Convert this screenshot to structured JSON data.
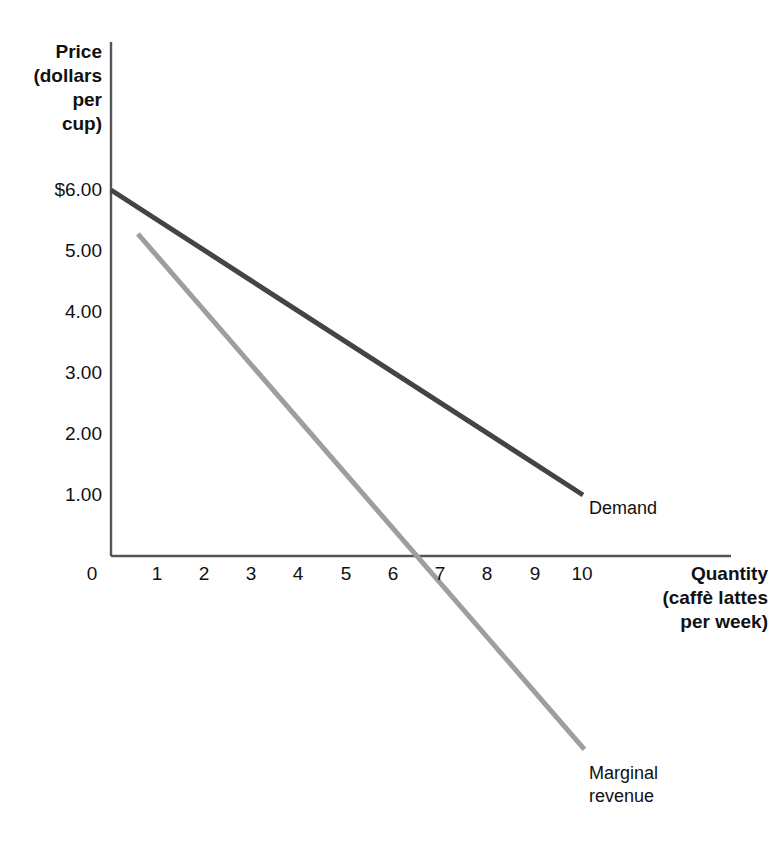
{
  "chart_data": {
    "type": "line",
    "title": "",
    "subtitle": "",
    "ylabel": "Price\n(dollars\nper\ncup)",
    "xlabel": "Quantity\n(caffè lattes\nper week)",
    "ylabel_lines": [
      "Price",
      "(dollars",
      "per",
      "cup)"
    ],
    "xlabel_lines": [
      "Quantity",
      "(caffè lattes",
      "per week)"
    ],
    "xlim": [
      0,
      10.6
    ],
    "ylim": [
      0,
      6.6
    ],
    "grid": false,
    "legend_position": "inline-end-of-line",
    "x_ticks": [
      "0",
      "1",
      "2",
      "3",
      "4",
      "5",
      "6",
      "7",
      "8",
      "9",
      "10"
    ],
    "x_tick_values": [
      0,
      1,
      2,
      3,
      4,
      5,
      6,
      7,
      8,
      9,
      10
    ],
    "y_ticks": [
      "$6.00",
      "5.00",
      "4.00",
      "3.00",
      "2.00",
      "1.00"
    ],
    "y_tick_values": [
      6,
      5,
      4,
      3,
      2,
      1
    ],
    "series": [
      {
        "name": "Demand",
        "label": "Demand",
        "color": "#444444",
        "width": 5,
        "points": [
          {
            "x": 0,
            "y": 6.0
          },
          {
            "x": 10,
            "y": 1.0
          }
        ]
      },
      {
        "name": "Marginal revenue",
        "label": "Marginal\nrevenue",
        "label_lines": [
          "Marginal",
          "revenue"
        ],
        "color": "#9e9e9e",
        "width": 5,
        "points": [
          {
            "x": 0.57,
            "y": 5.28
          },
          {
            "x": 6.48,
            "y": 0.0
          },
          {
            "x": 10.03,
            "y": -3.17
          }
        ]
      }
    ],
    "axis_color": "#555555",
    "annotations": [
      {
        "text": "Demand",
        "x": 10.05,
        "y": 0.95
      },
      {
        "text": "Marginal revenue",
        "x": 10.1,
        "y": -3.3
      }
    ]
  },
  "colors": {
    "demand": "#444444",
    "marginal_revenue": "#9e9e9e",
    "axis": "#555555",
    "text": "#111111",
    "background": "#ffffff"
  }
}
